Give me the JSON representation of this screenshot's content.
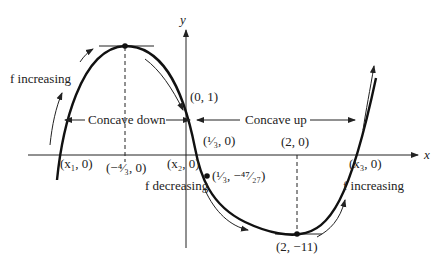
{
  "axes": {
    "x_label": "x",
    "y_label": "y"
  },
  "regions": {
    "concave_down": "Concave down",
    "concave_up": "Concave up"
  },
  "monotonic_labels": {
    "increasing_left": "f increasing",
    "decreasing": "f decreasing",
    "increasing_right": "f increasing"
  },
  "points": {
    "x1": "(x₁, 0)",
    "local_max_x": "(−⁴⁄₃, 0)",
    "x2": "(x₂, 0)",
    "y_intercept": "(0, 1)",
    "inflection_x": "(¹⁄₃, 0)",
    "inflection": "(¹⁄₃, −⁴⁷⁄₂₇)",
    "local_min_x": "(2, 0)",
    "local_min": "(2, −11)",
    "x3": "(x₃, 0)"
  },
  "colors": {
    "ink": "#222222",
    "background": "#ffffff"
  }
}
